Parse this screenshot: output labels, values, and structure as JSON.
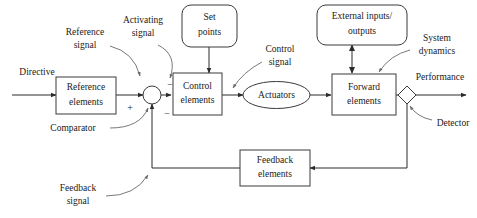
{
  "diagram": {
    "colors": {
      "background": "#ffffff",
      "box_stroke": "#3a3a3a",
      "line": "#2b2b2b",
      "annotation_line": "#6a6a6a",
      "text": "#1a1a1a"
    },
    "blocks": [
      {
        "id": "reference_elements",
        "label_line1": "Reference",
        "label_line2": "elements",
        "shape": "rectangle"
      },
      {
        "id": "control_elements",
        "label_line1": "Control",
        "label_line2": "elements",
        "shape": "rectangle"
      },
      {
        "id": "forward_elements",
        "label_line1": "Forward",
        "label_line2": "elements",
        "shape": "rectangle"
      },
      {
        "id": "feedback_elements",
        "label_line1": "Feedback",
        "label_line2": "elements",
        "shape": "rectangle"
      },
      {
        "id": "set_points",
        "label_line1": "Set",
        "label_line2": "points",
        "shape": "rounded-rectangle"
      },
      {
        "id": "external_io",
        "label_line1": "External inputs/",
        "label_line2": "outputs",
        "shape": "rounded-rectangle"
      },
      {
        "id": "actuators",
        "label_line1": "Actuators",
        "label_line2": "",
        "shape": "ellipse"
      },
      {
        "id": "comparator",
        "label_line1": "",
        "label_line2": "",
        "shape": "circle"
      },
      {
        "id": "detector",
        "label_line1": "",
        "label_line2": "",
        "shape": "diamond"
      }
    ],
    "signal_labels": {
      "directive": "Directive",
      "reference_signal_line1": "Reference",
      "reference_signal_line2": "signal",
      "activating_signal_line1": "Activating",
      "activating_signal_line2": "signal",
      "control_signal_line1": "Control",
      "control_signal_line2": "signal",
      "system_dynamics_line1": "System",
      "system_dynamics_line2": "dynamics",
      "performance": "Performance",
      "comparator": "Comparator",
      "detector": "Detector",
      "feedback_signal_line1": "Feedback",
      "feedback_signal_line2": "signal"
    },
    "signs": {
      "plus": "+",
      "minus": "−",
      "minus_lower": "−"
    }
  }
}
